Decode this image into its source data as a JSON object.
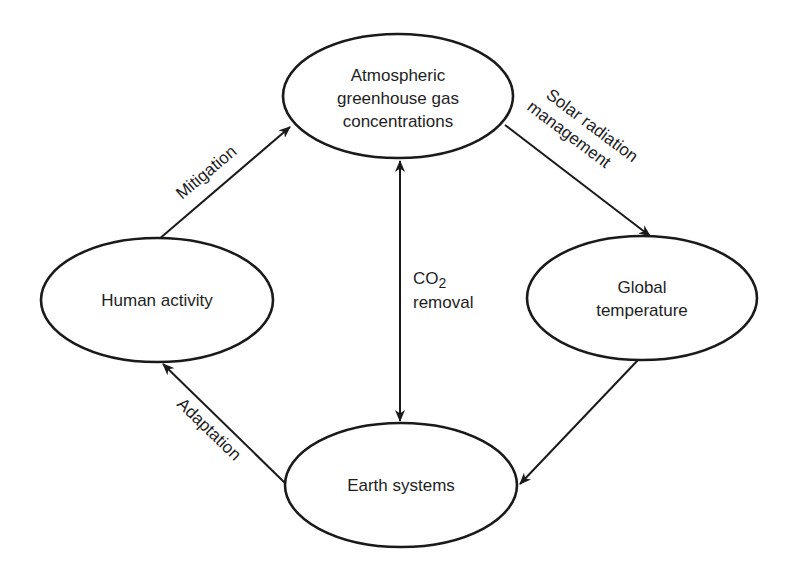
{
  "diagram": {
    "title": "",
    "nodes": [
      {
        "id": "atmospheric",
        "lines": [
          "Atmospheric",
          "greenhouse gas",
          "concentrations"
        ]
      },
      {
        "id": "global_temperature",
        "lines": [
          "Global",
          "temperature"
        ]
      },
      {
        "id": "earth_systems",
        "lines": [
          "Earth systems"
        ]
      },
      {
        "id": "human_activity",
        "lines": [
          "Human activity"
        ]
      }
    ],
    "edges": [
      {
        "from": "human_activity",
        "to": "atmospheric",
        "label": "Mitigation"
      },
      {
        "from": "atmospheric",
        "to": "global_temperature",
        "label_lines": [
          "Solar radiation",
          "management"
        ]
      },
      {
        "from": "global_temperature",
        "to": "earth_systems",
        "label": ""
      },
      {
        "from": "earth_systems",
        "to": "human_activity",
        "label": "Adaptation"
      },
      {
        "from": "atmospheric",
        "to": "earth_systems",
        "bidirectional": true,
        "label_lines": [
          "CO",
          "2",
          "removal"
        ]
      }
    ],
    "colors": {
      "stroke": "#1a1a1a",
      "text": "#1e1e1e",
      "background": "#ffffff"
    }
  }
}
